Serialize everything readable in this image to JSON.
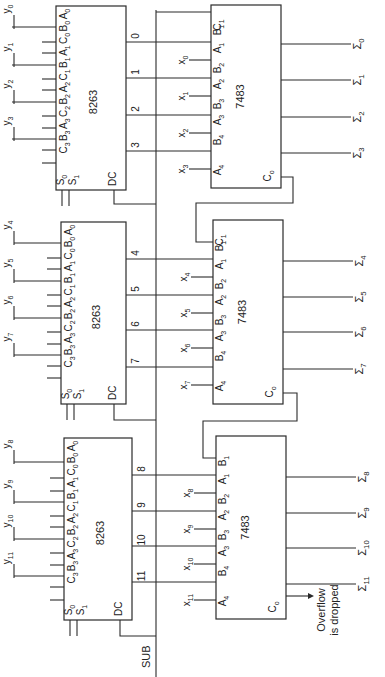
{
  "diagram": {
    "control": {
      "sub_label": "SUB"
    },
    "overflow_note": [
      "Overflow",
      "is dropped"
    ],
    "stages": [
      {
        "selector": {
          "chip": "8263",
          "pins": "C3 B3 A3 C2 B2 A2 C1 B1 A1 C0 B0 A0",
          "s0": "S0",
          "s1": "S1",
          "dc": "DC",
          "y_inputs": [
            "y0",
            "y1",
            "y2",
            "y3"
          ],
          "outputs": [
            "0",
            "1",
            "2",
            "3"
          ]
        },
        "adder": {
          "chip": "7483",
          "pins_in": [
            "C1",
            "B1",
            "A1",
            "B2",
            "A2",
            "B3",
            "A3",
            "B4",
            "A4"
          ],
          "co": "Co",
          "x_inputs": [
            "x0",
            "x1",
            "x2",
            "x3"
          ],
          "sums": [
            "Σ0",
            "Σ1",
            "Σ2",
            "Σ3"
          ]
        }
      },
      {
        "selector": {
          "chip": "8263",
          "y_inputs": [
            "y4",
            "y5",
            "y6",
            "y7"
          ],
          "outputs": [
            "4",
            "5",
            "6",
            "7"
          ]
        },
        "adder": {
          "chip": "7483",
          "x_inputs": [
            "x4",
            "x5",
            "x6",
            "x7"
          ],
          "sums": [
            "Σ4",
            "Σ5",
            "Σ6",
            "Σ7"
          ]
        }
      },
      {
        "selector": {
          "chip": "8263",
          "y_inputs": [
            "y8",
            "y9",
            "y10",
            "y11"
          ],
          "outputs": [
            "8",
            "9",
            "10",
            "11"
          ]
        },
        "adder": {
          "chip": "7483",
          "x_inputs": [
            "x8",
            "x9",
            "x10",
            "x11"
          ],
          "sums": [
            "Σ8",
            "Σ9",
            "Σ10",
            "Σ11"
          ]
        }
      }
    ]
  }
}
